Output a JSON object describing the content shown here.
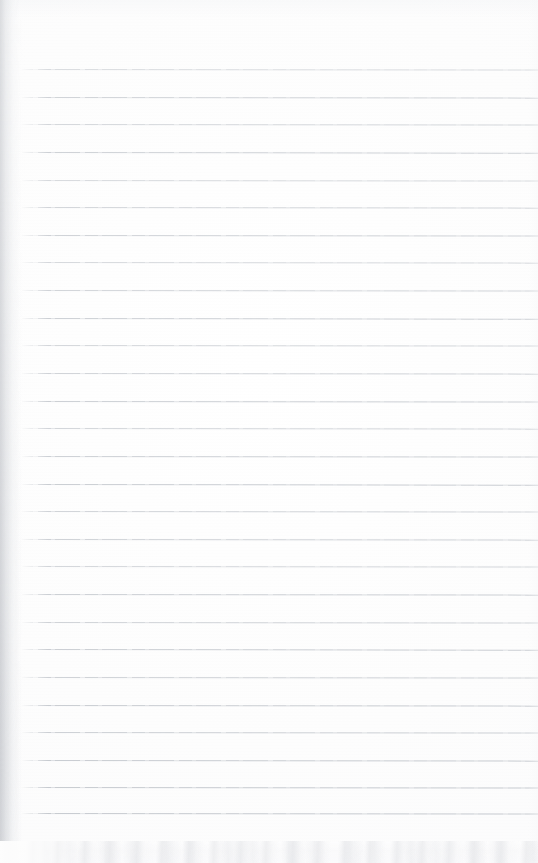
{
  "document": {
    "kind": "scanned-blank-ruled-page",
    "description": "Blank lined notebook page scan",
    "width": 538,
    "height": 863,
    "has_visible_text": false,
    "text_content": ""
  },
  "paper": {
    "background_color": "#fdfdfd",
    "tone_color": "#fbfbfc",
    "edge_shadow_color": "#d0d2d6",
    "bottom_band_color": "#fafafb",
    "bottom_band_mottle_color": "#e1e2e5"
  },
  "ruling": {
    "style": "horizontal-ruled",
    "line_color": "#c3c7cd",
    "line_thickness_px": 1,
    "line_count": 28,
    "first_line_y": 69,
    "last_line_y": 841,
    "line_spacing_px": 27.6,
    "line_start_x": 22,
    "line_end_x": 538,
    "slope_deg": 0.07,
    "header_space_px": 69,
    "lines": [
      {
        "index": 1,
        "y": 69,
        "opacity": 0.62,
        "slope": 0.06
      },
      {
        "index": 2,
        "y": 97,
        "opacity": 0.78,
        "slope": 0.07
      },
      {
        "index": 3,
        "y": 124,
        "opacity": 0.7,
        "slope": 0.05
      },
      {
        "index": 4,
        "y": 152,
        "opacity": 0.82,
        "slope": 0.08
      },
      {
        "index": 5,
        "y": 180,
        "opacity": 0.66,
        "slope": 0.06
      },
      {
        "index": 6,
        "y": 207,
        "opacity": 0.74,
        "slope": 0.07
      },
      {
        "index": 7,
        "y": 235,
        "opacity": 0.8,
        "slope": 0.05
      },
      {
        "index": 8,
        "y": 262,
        "opacity": 0.68,
        "slope": 0.07
      },
      {
        "index": 9,
        "y": 290,
        "opacity": 0.76,
        "slope": 0.06
      },
      {
        "index": 10,
        "y": 318,
        "opacity": 0.84,
        "slope": 0.08
      },
      {
        "index": 11,
        "y": 345,
        "opacity": 0.72,
        "slope": 0.06
      },
      {
        "index": 12,
        "y": 373,
        "opacity": 0.79,
        "slope": 0.07
      },
      {
        "index": 13,
        "y": 401,
        "opacity": 0.86,
        "slope": 0.05
      },
      {
        "index": 14,
        "y": 428,
        "opacity": 0.75,
        "slope": 0.07
      },
      {
        "index": 15,
        "y": 456,
        "opacity": 0.83,
        "slope": 0.06
      },
      {
        "index": 16,
        "y": 484,
        "opacity": 0.88,
        "slope": 0.08
      },
      {
        "index": 17,
        "y": 511,
        "opacity": 0.77,
        "slope": 0.06
      },
      {
        "index": 18,
        "y": 539,
        "opacity": 0.81,
        "slope": 0.07
      },
      {
        "index": 19,
        "y": 566,
        "opacity": 0.73,
        "slope": 0.05
      },
      {
        "index": 20,
        "y": 594,
        "opacity": 0.85,
        "slope": 0.07
      },
      {
        "index": 21,
        "y": 622,
        "opacity": 0.79,
        "slope": 0.06
      },
      {
        "index": 22,
        "y": 649,
        "opacity": 0.87,
        "slope": 0.08
      },
      {
        "index": 23,
        "y": 677,
        "opacity": 0.82,
        "slope": 0.06
      },
      {
        "index": 24,
        "y": 705,
        "opacity": 0.9,
        "slope": 0.07
      },
      {
        "index": 25,
        "y": 732,
        "opacity": 0.84,
        "slope": 0.05
      },
      {
        "index": 26,
        "y": 760,
        "opacity": 0.92,
        "slope": 0.07
      },
      {
        "index": 27,
        "y": 813,
        "opacity": 0.94,
        "slope": 0.06
      },
      {
        "index": 28,
        "y": 841,
        "opacity": 0.96,
        "slope": 0.07
      }
    ],
    "extra_lines": [
      {
        "index": 27,
        "y": 787,
        "opacity": 0.93,
        "slope": 0.06
      }
    ]
  }
}
